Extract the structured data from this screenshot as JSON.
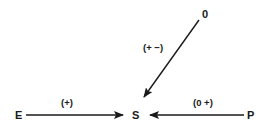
{
  "diagram": {
    "nodes": {
      "E": "E",
      "S": "S",
      "P": "P",
      "O": "0"
    },
    "edges": [
      {
        "from": "E",
        "to": "S",
        "label": "(+)"
      },
      {
        "from": "P",
        "to": "S",
        "label": "(0 +)"
      },
      {
        "from": "0",
        "to": "S",
        "label": "(+ −)"
      }
    ],
    "colors": {
      "line": "#1a1a1a",
      "background": "#ffffff"
    }
  }
}
